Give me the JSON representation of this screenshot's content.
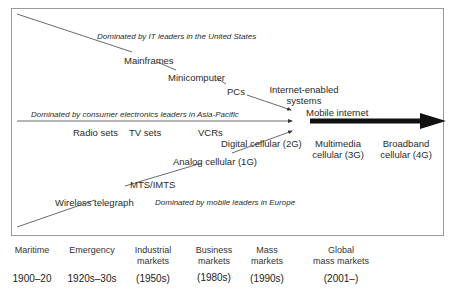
{
  "diagram": {
    "bands": {
      "it": "Dominated by IT leaders in the United States",
      "consumer": "Dominated by consumer electronics leaders in Asia-Pacific",
      "mobile": "Dominated by mobile leaders in Europe"
    },
    "it_path": [
      "Mainframes",
      "Minicomputer",
      "PCs"
    ],
    "convergence": {
      "internet_line1": "Internet-enabled",
      "internet_line2": "systems",
      "mobile_internet": "Mobile internet"
    },
    "consumer_path": [
      "Radio sets",
      "TV sets",
      "VCRs"
    ],
    "mobile_path": [
      "Wireless telegraph",
      "MTS/IMTS",
      "Analog cellular (1G)",
      "Digital cellular (2G)"
    ],
    "future": [
      {
        "line1": "Multimedia",
        "line2": "cellular (3G)"
      },
      {
        "line1": "Broadband",
        "line2": "cellular (4G)"
      }
    ],
    "colors": {
      "line": "#333333",
      "arrow": "#111111",
      "frame": "#9a9a9a"
    }
  },
  "timeline": [
    {
      "era_line1": "Maritime",
      "era_line2": "",
      "years": "1900–20"
    },
    {
      "era_line1": "Emergency",
      "era_line2": "",
      "years": "1920s–30s"
    },
    {
      "era_line1": "Industrial",
      "era_line2": "markets",
      "years": "(1950s)"
    },
    {
      "era_line1": "Business",
      "era_line2": "markets",
      "years": "(1980s)"
    },
    {
      "era_line1": "Mass",
      "era_line2": "markets",
      "years": "(1990s)"
    },
    {
      "era_line1": "Global",
      "era_line2": "mass markets",
      "years": "(2001–)"
    }
  ]
}
